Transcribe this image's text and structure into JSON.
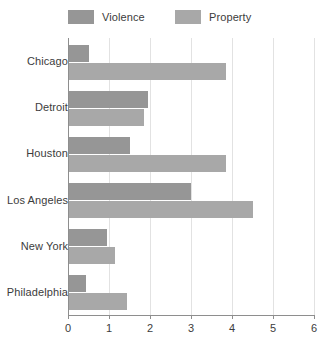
{
  "chart_data": {
    "type": "bar",
    "orientation": "horizontal",
    "title": "",
    "xlabel": "",
    "ylabel": "",
    "xlim": [
      0,
      6
    ],
    "xticks": [
      "0",
      "1",
      "2",
      "3",
      "4",
      "5",
      "6"
    ],
    "grid": "vertical",
    "legend_position": "top",
    "categories": [
      "Chicago",
      "Detroit",
      "Houston",
      "Los Angeles",
      "New York",
      "Philadelphia"
    ],
    "series": [
      {
        "name": "Violence",
        "color": "#969696",
        "values": [
          0.5,
          1.95,
          1.5,
          3.0,
          0.95,
          0.45
        ]
      },
      {
        "name": "Property",
        "color": "#a8a8a8",
        "values": [
          3.85,
          1.85,
          3.85,
          4.5,
          1.15,
          1.45
        ]
      }
    ]
  },
  "legend": {
    "items": [
      {
        "label": "Violence",
        "color": "#969696"
      },
      {
        "label": "Property",
        "color": "#a8a8a8"
      }
    ]
  },
  "axis": {
    "x_tick_labels": [
      "0",
      "1",
      "2",
      "3",
      "4",
      "5",
      "6"
    ],
    "y_tick_labels": [
      "Chicago",
      "Detroit",
      "Houston",
      "Los Angeles",
      "New York",
      "Philadelphia"
    ],
    "axis_color": "#8e8e8e",
    "grid_color": "#e2e2e2"
  }
}
